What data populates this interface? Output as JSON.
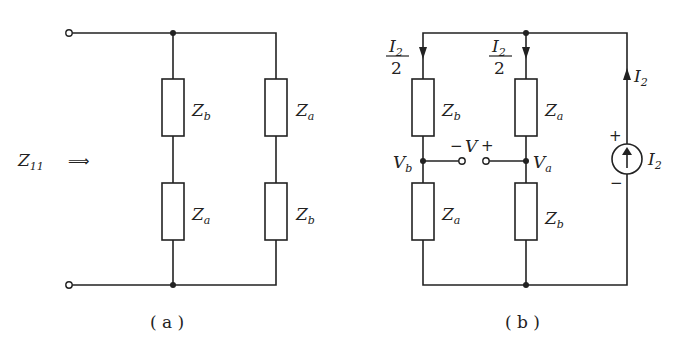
{
  "figure_a": {
    "caption": "( a )",
    "input_impedance": {
      "base": "Z",
      "sub": "11"
    },
    "arrow": "⟹",
    "branch_left": {
      "top": {
        "base": "Z",
        "sub": "b"
      },
      "bottom": {
        "base": "Z",
        "sub": "a"
      }
    },
    "branch_right": {
      "top": {
        "base": "Z",
        "sub": "a"
      },
      "bottom": {
        "base": "Z",
        "sub": "b"
      }
    }
  },
  "figure_b": {
    "caption": "( b )",
    "current_left": {
      "num_base": "I",
      "num_sub": "2",
      "den": "2"
    },
    "current_mid": {
      "num_base": "I",
      "num_sub": "2",
      "den": "2"
    },
    "current_source_branch": {
      "base": "I",
      "sub": "2"
    },
    "source_label": {
      "base": "I",
      "sub": "2"
    },
    "source_plus": "+",
    "source_minus": "−",
    "branch_left": {
      "top": {
        "base": "Z",
        "sub": "b"
      },
      "bottom": {
        "base": "Z",
        "sub": "a"
      },
      "node": {
        "base": "V",
        "sub": "b"
      }
    },
    "branch_mid": {
      "top": {
        "base": "Z",
        "sub": "a"
      },
      "bottom": {
        "base": "Z",
        "sub": "b"
      },
      "node": {
        "base": "V",
        "sub": "a"
      }
    },
    "open_voltage": {
      "minus": "−",
      "label": "V",
      "plus": "+"
    }
  }
}
